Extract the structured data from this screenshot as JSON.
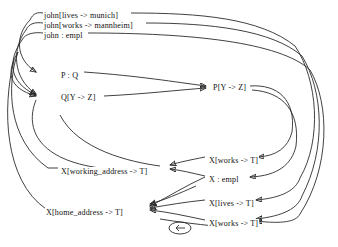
{
  "diagram": {
    "type": "derivation-graph",
    "background_color": "#ffffff",
    "edge_color": "#2b2b2b",
    "text_color": "#111111",
    "nodes": [
      {
        "id": "n1",
        "label": "john[lives -> munich]",
        "x": 43,
        "y": 11
      },
      {
        "id": "n2",
        "label": "john[works -> mannheim]",
        "x": 43,
        "y": 21
      },
      {
        "id": "n3",
        "label": "john : empl",
        "x": 43,
        "y": 31
      },
      {
        "id": "n4",
        "label": "P : Q",
        "x": 60,
        "y": 71
      },
      {
        "id": "n5",
        "label": "Q[Y -> Z]",
        "x": 60,
        "y": 93
      },
      {
        "id": "n6",
        "label": "P[Y -> Z]",
        "x": 212,
        "y": 83
      },
      {
        "id": "n7",
        "label": "X[working_address -> T]",
        "x": 60,
        "y": 167
      },
      {
        "id": "n8",
        "label": "X[works -> T]",
        "x": 208,
        "y": 156
      },
      {
        "id": "n9",
        "label": "X : empl",
        "x": 208,
        "y": 175
      },
      {
        "id": "n10",
        "label": "X[home_address -> T]",
        "x": 45,
        "y": 208
      },
      {
        "id": "n11",
        "label": "X[lives -> T]",
        "x": 208,
        "y": 199
      },
      {
        "id": "n12",
        "label": "X[works -> T]",
        "x": 208,
        "y": 219
      }
    ],
    "self_loop_marker": {
      "name": "self-loop-ellipse",
      "cx": 180,
      "cy": 228,
      "rx": 11,
      "ry": 6
    }
  }
}
